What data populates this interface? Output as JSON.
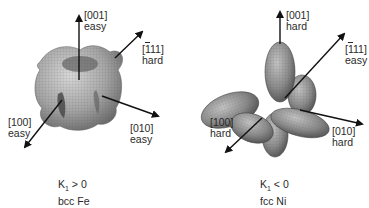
{
  "panels": [
    {
      "id": "fe",
      "axes": {
        "z": {
          "index": "[001]",
          "type": "easy"
        },
        "diag": {
          "index_pre": "[",
          "index_bar": "1",
          "index_post": "11]",
          "type": "hard"
        },
        "x": {
          "index": "[100]",
          "type": "easy"
        },
        "y": {
          "index": "[010]",
          "type": "easy"
        }
      },
      "caption": {
        "k_prefix": "K",
        "k_sub": "1",
        "k_rel": " > 0",
        "material": "bcc Fe"
      },
      "surface_color": "#a8a8a8"
    },
    {
      "id": "ni",
      "axes": {
        "z": {
          "index": "[001]",
          "type": "hard"
        },
        "diag": {
          "index_pre": "[",
          "index_bar": "1",
          "index_post": "11]",
          "type": "easy"
        },
        "x": {
          "index": "[100]",
          "type": "hard"
        },
        "y": {
          "index": "[010]",
          "type": "hard"
        }
      },
      "caption": {
        "k_prefix": "K",
        "k_sub": "1",
        "k_rel": " < 0",
        "material": "fcc Ni"
      },
      "surface_color": "#8a8a8a"
    }
  ]
}
